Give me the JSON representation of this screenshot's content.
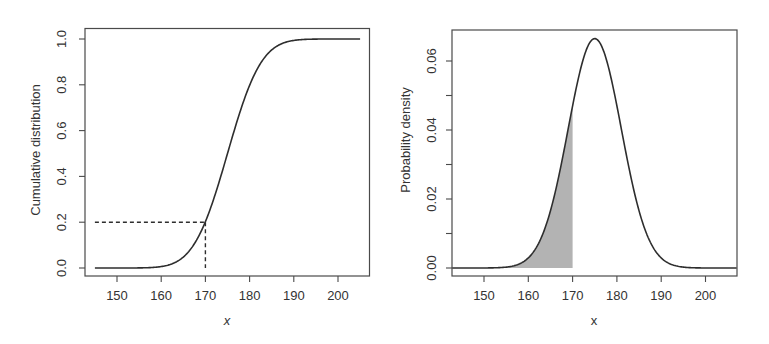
{
  "chart_data": [
    {
      "type": "line",
      "title": "",
      "xlabel": "x",
      "xlabel_italic": true,
      "ylabel": "Cumulative distribution",
      "xlim": [
        143,
        207.5
      ],
      "ylim": [
        -0.04,
        1.05
      ],
      "xticks": [
        150,
        160,
        170,
        180,
        190,
        200
      ],
      "yticks": [
        0.0,
        0.2,
        0.4,
        0.6,
        0.8,
        1.0
      ],
      "ytick_labels": [
        "0.0",
        "0.2",
        "0.4",
        "0.6",
        "0.8",
        "1.0"
      ],
      "grid": false,
      "legend": null,
      "distribution": {
        "family": "normal",
        "mean": 175,
        "sd": 6
      },
      "x_range": [
        145,
        205
      ],
      "series": [
        {
          "name": "CDF",
          "x": [
            145,
            150,
            155,
            160,
            165,
            170,
            175,
            180,
            185,
            190,
            195,
            200,
            205
          ],
          "values": [
            0.0,
            0.0,
            0.0004,
            0.0062,
            0.0478,
            0.2023,
            0.5,
            0.7977,
            0.9522,
            0.9938,
            0.9996,
            1.0,
            1.0
          ]
        }
      ],
      "annotations": [
        {
          "type": "dashed-hline",
          "y": 0.2,
          "x_from": 145,
          "x_to": 170
        },
        {
          "type": "dashed-vline",
          "x": 170,
          "y_from": 0.0,
          "y_to": 0.2
        }
      ]
    },
    {
      "type": "area",
      "title": "",
      "xlabel": "x",
      "xlabel_italic": false,
      "ylabel": "Probability density",
      "xlim": [
        142.8,
        207.2
      ],
      "ylim": [
        -0.0026,
        0.0688
      ],
      "xticks": [
        150,
        160,
        170,
        180,
        190,
        200
      ],
      "yticks": [
        0.0,
        0.01,
        0.02,
        0.03,
        0.04,
        0.05,
        0.06
      ],
      "ytick_labels": [
        "0.00",
        "",
        "0.02",
        "",
        "0.04",
        "",
        "0.06"
      ],
      "grid": false,
      "legend": null,
      "distribution": {
        "family": "normal",
        "mean": 175,
        "sd": 6
      },
      "x_range": [
        142.8,
        207.2
      ],
      "series": [
        {
          "name": "PDF",
          "x": [
            145,
            150,
            155,
            160,
            165,
            170,
            175,
            180,
            185,
            190,
            195,
            200,
            205
          ],
          "values": [
            0.0,
            0.0,
            0.0004,
            0.0029,
            0.0166,
            0.047,
            0.0665,
            0.047,
            0.0166,
            0.0029,
            0.0004,
            0.0,
            0.0
          ]
        }
      ],
      "shaded_region": {
        "x_from": 142.8,
        "x_to": 170,
        "fill": "#b3b3b3",
        "area": 0.2
      }
    }
  ],
  "colors": {
    "curve": "#2e2e2e",
    "frame": "#4a4a4a",
    "text": "#333333",
    "shade": "#b3b3b3"
  }
}
